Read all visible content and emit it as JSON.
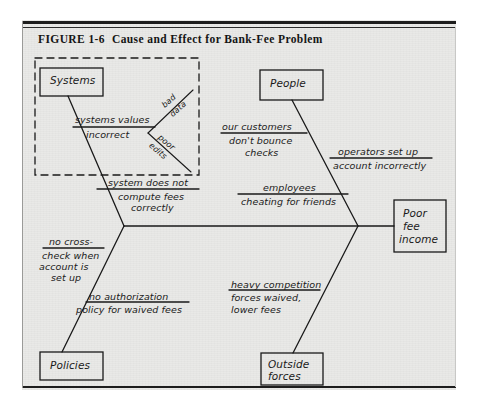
{
  "figure": {
    "number": "FIGURE 1-6",
    "title": "Cause and Effect for Bank-Fee Problem"
  },
  "diagram": {
    "type": "fishbone-cause-and-effect",
    "effect": {
      "label_line1": "Poor",
      "label_line2": "fee",
      "label_line3": "income"
    },
    "categories": [
      {
        "name": "Systems",
        "label": "Systems",
        "position": "top-left",
        "highlighted": true,
        "causes": [
          {
            "line1": "systems values",
            "line2": "incorrect",
            "sub_causes": [
              {
                "line1": "bad",
                "line2": "data"
              },
              {
                "line1": "poor",
                "line2": "edits"
              }
            ]
          },
          {
            "line1": "system does not",
            "line2": "compute fees",
            "line3": "correctly",
            "sub_causes": []
          }
        ]
      },
      {
        "name": "People",
        "label": "People",
        "position": "top-right",
        "highlighted": false,
        "causes": [
          {
            "line1": "our customers",
            "line2": "don't bounce",
            "line3": "checks",
            "sub_causes": []
          },
          {
            "line1": "operators set up",
            "line2": "account incorrectly",
            "sub_causes": []
          },
          {
            "line1": "employees",
            "line2": "cheating for friends",
            "sub_causes": []
          }
        ]
      },
      {
        "name": "Policies",
        "label": "Policies",
        "position": "bottom-left",
        "highlighted": false,
        "causes": [
          {
            "line1": "no cross-",
            "line2": "check when",
            "line3": "account is",
            "line4": "set up",
            "sub_causes": []
          },
          {
            "line1": "no authorization",
            "line2": "policy for waived fees",
            "sub_causes": []
          }
        ]
      },
      {
        "name": "Outside forces",
        "label_line1": "Outside",
        "label_line2": "forces",
        "position": "bottom-right",
        "highlighted": false,
        "causes": [
          {
            "line1": "heavy competition",
            "line2": "forces waived,",
            "line3": "lower fees",
            "sub_causes": []
          }
        ]
      }
    ],
    "annotation": {
      "dashed_highlight_region": "Systems branch"
    },
    "colors": {
      "ink": "#1a1a1a",
      "paper": "#e9e9e7",
      "page": "#ffffff"
    }
  }
}
